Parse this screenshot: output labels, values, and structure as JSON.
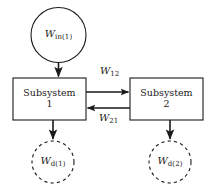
{
  "diagram": {
    "type": "block-flow-diagram",
    "canvas": {
      "width": 215,
      "height": 185,
      "background": "#ffffff"
    },
    "colors": {
      "stroke": "#1a1a1a",
      "text": "#1a1a1a",
      "background": "#ffffff"
    },
    "nodes": [
      {
        "id": "w-in-1",
        "shape": "circle",
        "style": "solid",
        "symbol": "W",
        "subscript": "in(1)",
        "cx": 58.5,
        "cy": 35,
        "r": 27.5
      },
      {
        "id": "subsystem-1",
        "shape": "rect",
        "style": "solid",
        "line1": "Subsystem",
        "line2": "1",
        "x": 13,
        "y": 78,
        "width": 73,
        "height": 42
      },
      {
        "id": "subsystem-2",
        "shape": "rect",
        "style": "solid",
        "line1": "Subsystem",
        "line2": "2",
        "x": 130,
        "y": 78,
        "width": 73,
        "height": 42
      },
      {
        "id": "w-d-1",
        "shape": "circle",
        "style": "dashed",
        "symbol": "W",
        "subscript": "d(1)",
        "cx": 53,
        "cy": 162,
        "r": 21
      },
      {
        "id": "w-d-2",
        "shape": "circle",
        "style": "dashed",
        "symbol": "W",
        "subscript": "d(2)",
        "cx": 170,
        "cy": 162,
        "r": 21
      }
    ],
    "edges": [
      {
        "id": "input-to-subsystem-1",
        "from": "w-in-1",
        "to": "subsystem-1",
        "direction": "down",
        "label": "",
        "sublabel": ""
      },
      {
        "id": "subsystem-1-to-2",
        "from": "subsystem-1",
        "to": "subsystem-2",
        "direction": "right",
        "symbol": "W",
        "subscript": "12"
      },
      {
        "id": "subsystem-2-to-1",
        "from": "subsystem-2",
        "to": "subsystem-1",
        "direction": "left",
        "symbol": "W",
        "subscript": "21"
      },
      {
        "id": "subsystem-1-dissipation",
        "from": "subsystem-1",
        "to": "w-d-1",
        "direction": "down",
        "label": "",
        "sublabel": ""
      },
      {
        "id": "subsystem-2-dissipation",
        "from": "subsystem-2",
        "to": "w-d-2",
        "direction": "down",
        "label": "",
        "sublabel": ""
      }
    ],
    "labels": {
      "w_in_1": {
        "symbol": "W",
        "subscript": "in(1)"
      },
      "w_d_1": {
        "symbol": "W",
        "subscript": "d(1)"
      },
      "w_d_2": {
        "symbol": "W",
        "subscript": "d(2)"
      },
      "w_12": {
        "symbol": "W",
        "subscript": "12"
      },
      "w_21": {
        "symbol": "W",
        "subscript": "21"
      },
      "subsystem_1_line1": "Subsystem",
      "subsystem_1_line2": "1",
      "subsystem_2_line1": "Subsystem",
      "subsystem_2_line2": "2"
    }
  }
}
